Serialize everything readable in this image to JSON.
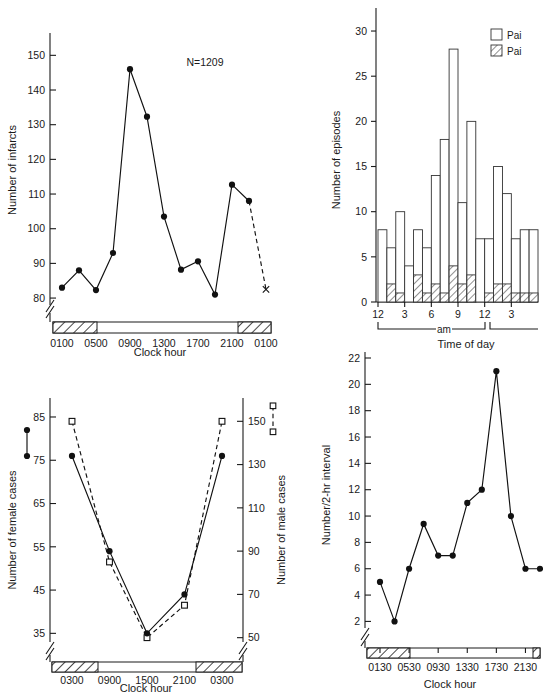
{
  "figure": {
    "panels": [
      "infarcts-by-clock-hour",
      "episodes-by-time-of-day",
      "cases-by-sex",
      "number-per-2hr-interval"
    ]
  },
  "chart_data": [
    {
      "id": "panel-top-left",
      "type": "line",
      "title": "",
      "annotation": "N=1209",
      "xlabel": "Clock hour",
      "ylabel": "Number of infarcts",
      "ylim": [
        78,
        155
      ],
      "yticks": [
        80,
        90,
        100,
        110,
        120,
        130,
        140,
        150
      ],
      "ytick_labels": [
        "80",
        "90",
        "100",
        "110",
        "120",
        "130",
        "140",
        "150"
      ],
      "axis_break": true,
      "xticks": [
        "0100",
        "0500",
        "0900",
        "1300",
        "1700",
        "2100",
        "0100"
      ],
      "x": [
        "0100",
        "0300",
        "0500",
        "0700",
        "0900",
        "1100",
        "1300",
        "1500",
        "1700",
        "1900",
        "2100",
        "2300",
        "0100"
      ],
      "values": [
        83,
        88,
        82.3,
        93,
        146,
        132.3,
        103.5,
        88.2,
        90.6,
        81,
        112.7,
        108,
        82.5
      ],
      "last_point_marker": "x",
      "last_segment_style": "dashed",
      "grid": false,
      "night_shading": [
        {
          "from": "0000",
          "to": "0600"
        },
        {
          "from": "2200",
          "to": "0100"
        }
      ]
    },
    {
      "id": "panel-top-right",
      "type": "bar",
      "title": "",
      "xlabel": "Time of day",
      "ylabel": "Number of episodes",
      "ylim": [
        0,
        31
      ],
      "yticks": [
        0,
        5,
        10,
        15,
        20,
        25,
        30
      ],
      "ytick_labels": [
        "0",
        "5",
        "10",
        "15",
        "20",
        "25",
        "30"
      ],
      "xtick_labels": [
        "12",
        "3",
        "6",
        "9",
        "12",
        "3"
      ],
      "period_labels": [
        "am"
      ],
      "legend": [
        {
          "label": "Pai",
          "pattern": "open"
        },
        {
          "label": "Pai",
          "pattern": "hatched"
        }
      ],
      "categories": [
        "12am",
        "1am",
        "2am",
        "3am",
        "4am",
        "5am",
        "6am",
        "7am",
        "8am",
        "9am",
        "10am",
        "11am",
        "12pm",
        "1pm",
        "2pm",
        "3pm",
        "4pm",
        "5pm"
      ],
      "series": [
        {
          "name": "total",
          "values": [
            8,
            6,
            10,
            4,
            8,
            6,
            14,
            18,
            28,
            11,
            20,
            7,
            7,
            15,
            12,
            7,
            8,
            8
          ]
        },
        {
          "name": "hatched",
          "values": [
            0,
            2,
            1,
            0,
            3,
            1,
            2,
            1,
            4,
            2,
            3,
            0,
            1,
            2,
            2,
            1,
            1,
            1
          ]
        }
      ],
      "grid": false
    },
    {
      "id": "panel-bottom-left",
      "type": "line",
      "title": "",
      "xlabel": "Clock hour",
      "ylabel_left": "Number of female cases",
      "ylabel_right": "Number of male cases",
      "left_marker": "filled-circle-solid-line",
      "right_marker": "open-square-dashed-line",
      "ylim_left": [
        33,
        88
      ],
      "yticks_left": [
        35,
        45,
        55,
        65,
        75,
        85
      ],
      "ytick_labels_left": [
        "35",
        "45",
        "55",
        "65",
        "75",
        "85"
      ],
      "ylim_right": [
        48,
        158
      ],
      "yticks_right": [
        50,
        70,
        90,
        110,
        130,
        150
      ],
      "ytick_labels_right": [
        "50",
        "70",
        "90",
        "110",
        "130",
        "150"
      ],
      "axis_break": true,
      "xticks": [
        "0300",
        "0900",
        "1500",
        "2100",
        "0300"
      ],
      "x": [
        "0300",
        "0900",
        "1500",
        "2100",
        "0300"
      ],
      "series": [
        {
          "name": "female",
          "axis": "left",
          "values": [
            76,
            54,
            35,
            44,
            76
          ]
        },
        {
          "name": "male",
          "axis": "right",
          "values": [
            150,
            85,
            50,
            65,
            150
          ]
        }
      ],
      "grid": false,
      "night_shading": [
        {
          "from": "0000",
          "to": "0700"
        },
        {
          "from": "2200",
          "to": "0300"
        }
      ]
    },
    {
      "id": "panel-bottom-right",
      "type": "line",
      "title": "",
      "xlabel": "Clock hour",
      "ylabel": "Number/2-hr interval",
      "ylim": [
        1.5,
        22
      ],
      "yticks": [
        2,
        4,
        6,
        8,
        10,
        12,
        14,
        16,
        18,
        20,
        22
      ],
      "ytick_labels": [
        "2",
        "4",
        "6",
        "8",
        "10",
        "12",
        "14",
        "16",
        "18",
        "20",
        "22"
      ],
      "axis_break": true,
      "xticks": [
        "0130",
        "0530",
        "0930",
        "1330",
        "1730",
        "2130"
      ],
      "x": [
        "0130",
        "0330",
        "0530",
        "0730",
        "0930",
        "1130",
        "1330",
        "1530",
        "1730",
        "1930",
        "2130",
        "2330"
      ],
      "values": [
        5,
        2,
        6,
        9.4,
        7,
        7,
        11,
        12,
        21,
        10,
        6,
        6
      ],
      "grid": false,
      "night_shading": [
        {
          "from": "0030",
          "to": "0600"
        }
      ]
    }
  ]
}
